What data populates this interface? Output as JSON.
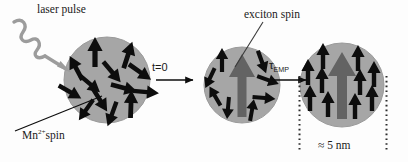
{
  "figure": {
    "kind": "schematic-diagram",
    "topic": "exciton magnetic polaron formation in a magnetically doped quantum dot",
    "background_color": "#fdfdfd"
  },
  "colors": {
    "sphere_fill": "#a6a6a6",
    "sphere_edge": "#9a9a9a",
    "mn_arrow": "#0d0d0d",
    "exciton_arrow": "#636363",
    "laser_arrow": "#9c9c9c",
    "text": "#1a1a1a",
    "timeline_arrow": "#0d0d0d",
    "dotted_guide": "#2b2b2b"
  },
  "labels": {
    "laser_pulse": "laser pulse",
    "mn_spin_prefix": "Mn",
    "mn_spin_charge": "2+",
    "mn_spin_suffix": "spin",
    "exciton_spin": "exciton spin",
    "time_zero": "t=0",
    "tau_symbol": "τ",
    "tau_subscript": "EMP",
    "size_label": "≈ 5 nm"
  },
  "icons": {
    "laser": "squiggly-arrow-icon",
    "mn_pointer": "pointer-line-icon",
    "exciton_pointer": "pointer-line-icon",
    "step_arrow": "right-arrow-icon",
    "size_guide": "dotted-vertical-line-icon"
  },
  "stages": [
    {
      "id": "stage-1",
      "name": "randomized-mn-spins",
      "cx": 107,
      "cy": 80,
      "r": 43,
      "has_exciton": false,
      "caption": "Mn 2+ spin",
      "mn_arrows": [
        {
          "x": 95,
          "y": 52,
          "angle": 0,
          "len": 30
        },
        {
          "x": 128,
          "y": 55,
          "angle": 18,
          "len": 28
        },
        {
          "x": 76,
          "y": 68,
          "angle": -28,
          "len": 27
        },
        {
          "x": 112,
          "y": 72,
          "angle": 140,
          "len": 27
        },
        {
          "x": 140,
          "y": 72,
          "angle": 125,
          "len": 27
        },
        {
          "x": 90,
          "y": 84,
          "angle": 130,
          "len": 26
        },
        {
          "x": 124,
          "y": 88,
          "angle": 105,
          "len": 27
        },
        {
          "x": 70,
          "y": 92,
          "angle": 120,
          "len": 26
        },
        {
          "x": 146,
          "y": 92,
          "angle": 95,
          "len": 26
        },
        {
          "x": 100,
          "y": 100,
          "angle": 148,
          "len": 27
        },
        {
          "x": 131,
          "y": 104,
          "angle": 2,
          "len": 28
        },
        {
          "x": 112,
          "y": 114,
          "angle": 200,
          "len": 26
        },
        {
          "x": 86,
          "y": 110,
          "angle": 215,
          "len": 25
        }
      ]
    },
    {
      "id": "stage-2",
      "name": "exciton-created-spins-random",
      "cx": 242,
      "cy": 85,
      "r": 38,
      "has_exciton": true,
      "caption": "exciton spin",
      "mn_arrows": [
        {
          "x": 222,
          "y": 60,
          "angle": 0,
          "len": 24
        },
        {
          "x": 262,
          "y": 62,
          "angle": 160,
          "len": 24
        },
        {
          "x": 210,
          "y": 78,
          "angle": 205,
          "len": 22
        },
        {
          "x": 268,
          "y": 80,
          "angle": 110,
          "len": 23
        },
        {
          "x": 215,
          "y": 96,
          "angle": 330,
          "len": 22
        },
        {
          "x": 264,
          "y": 98,
          "angle": 95,
          "len": 23
        },
        {
          "x": 228,
          "y": 108,
          "angle": 185,
          "len": 22
        },
        {
          "x": 252,
          "y": 110,
          "angle": 10,
          "len": 22
        }
      ]
    },
    {
      "id": "stage-3",
      "name": "aligned-mn-spins-polaron",
      "cx": 342,
      "cy": 85,
      "r": 42,
      "has_exciton": true,
      "caption": "≈ 5 nm",
      "mn_arrows": [
        {
          "x": 323,
          "y": 56,
          "angle": 0,
          "len": 26
        },
        {
          "x": 358,
          "y": 58,
          "angle": 0,
          "len": 26
        },
        {
          "x": 308,
          "y": 72,
          "angle": 0,
          "len": 26
        },
        {
          "x": 374,
          "y": 74,
          "angle": 0,
          "len": 26
        },
        {
          "x": 322,
          "y": 80,
          "angle": 0,
          "len": 26
        },
        {
          "x": 360,
          "y": 82,
          "angle": 0,
          "len": 26
        },
        {
          "x": 310,
          "y": 98,
          "angle": 0,
          "len": 26
        },
        {
          "x": 372,
          "y": 98,
          "angle": 0,
          "len": 26
        },
        {
          "x": 328,
          "y": 104,
          "angle": 0,
          "len": 26
        },
        {
          "x": 355,
          "y": 106,
          "angle": 0,
          "len": 26
        }
      ]
    }
  ],
  "transitions": [
    {
      "id": "transition-1",
      "name": "t-zero-arrow",
      "label": "t=0",
      "x1": 156,
      "x2": 198,
      "y": 80
    },
    {
      "id": "transition-2",
      "name": "tau-emp-arrow",
      "label": "τ EMP",
      "x1": 272,
      "x2": 310,
      "y": 80
    }
  ],
  "size_guides": [
    {
      "id": "guide-left",
      "x": 299,
      "y1": 76,
      "y2": 152
    },
    {
      "id": "guide-right",
      "x": 387,
      "y1": 76,
      "y2": 152
    }
  ]
}
